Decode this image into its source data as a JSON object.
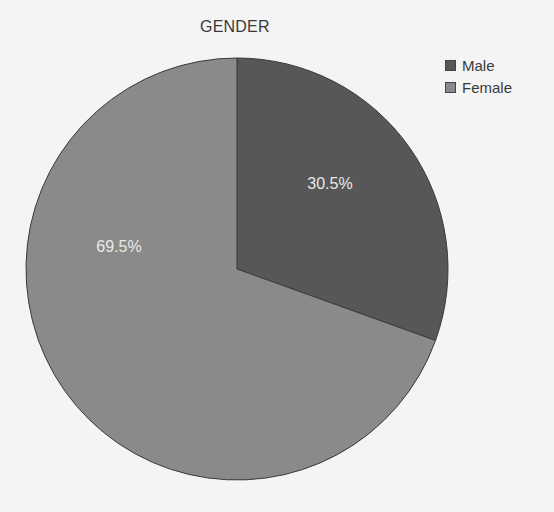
{
  "chart_data": {
    "type": "pie",
    "title": "GENDER",
    "categories": [
      "Male",
      "Female"
    ],
    "values": [
      30.5,
      69.5
    ],
    "units": "%",
    "colors": [
      "#575757",
      "#8a8a8a"
    ],
    "data_labels": [
      "30.5%",
      "69.5%"
    ],
    "legend_position": "top-right",
    "start_angle": "12 o'clock, clockwise"
  },
  "legend": {
    "items": [
      {
        "label": "Male",
        "color": "#575757"
      },
      {
        "label": "Female",
        "color": "#8a8a8a"
      }
    ]
  }
}
